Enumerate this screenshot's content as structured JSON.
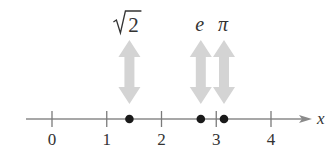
{
  "diagram": {
    "type": "number-line",
    "axis": {
      "label": "x",
      "min_value": -0.5,
      "max_value": 4.75,
      "pixel_origin": 52,
      "pixel_per_unit": 54.75,
      "y": 119,
      "line_start_x": 26,
      "arrow_tip_x": 312,
      "color": "#8a8a8a"
    },
    "ticks": [
      {
        "value": 0,
        "label": "0"
      },
      {
        "value": 1,
        "label": "1"
      },
      {
        "value": 2,
        "label": "2"
      },
      {
        "value": 3,
        "label": "3"
      },
      {
        "value": 4,
        "label": "4"
      }
    ],
    "points": [
      {
        "name": "sqrt2",
        "label": "√2",
        "value": 1.414,
        "italic": false
      },
      {
        "name": "e",
        "label": "e",
        "value": 2.718,
        "italic": true
      },
      {
        "name": "pi",
        "label": "π",
        "value": 3.1416,
        "italic": true
      }
    ],
    "point_color": "#1a1a1a",
    "arrow_color": "#d4d4d4"
  }
}
